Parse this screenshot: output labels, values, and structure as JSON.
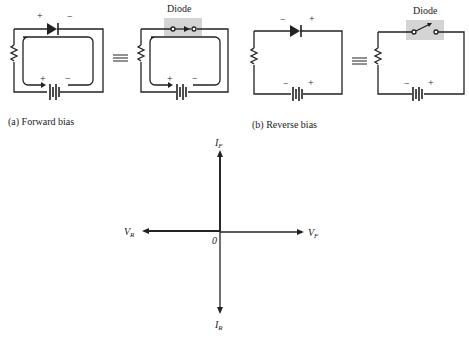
{
  "figure": {
    "forward": {
      "caption": "(a) Forward bias",
      "diode_label": "Diode",
      "diode_plus": "+",
      "diode_minus": "−",
      "battery_plus": "+",
      "battery_minus": "−",
      "equiv_batt_plus": "+",
      "equiv_batt_minus": "−",
      "switch_state": "closed"
    },
    "reverse": {
      "caption": "(b) Reverse bias",
      "diode_label": "Diode",
      "diode_plus": "+",
      "diode_minus": "−",
      "battery_plus": "+",
      "battery_minus": "−",
      "equiv_batt_plus": "+",
      "equiv_batt_minus": "−",
      "switch_state": "open"
    },
    "equivalence_symbol": "≡",
    "axes": {
      "i_forward": "I",
      "i_forward_sub": "F",
      "i_reverse": "I",
      "i_reverse_sub": "R",
      "v_forward": "V",
      "v_forward_sub": "F",
      "v_reverse": "V",
      "v_reverse_sub": "R",
      "origin": "0"
    },
    "colors": {
      "ink": "#222222",
      "switch_box": "#d4d4d4"
    }
  }
}
